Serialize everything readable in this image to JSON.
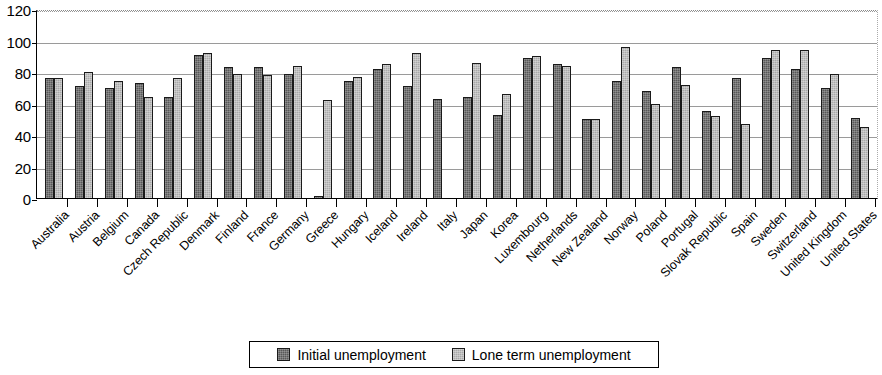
{
  "chart_data": {
    "type": "bar",
    "title": "",
    "subtitle": "",
    "xlabel": "",
    "ylabel": "",
    "ylim": [
      0,
      120
    ],
    "yticks": [
      0,
      20,
      40,
      60,
      80,
      100,
      120
    ],
    "grid": true,
    "legend_position": "bottom",
    "orientation": "vertical",
    "categories": [
      "Australia",
      "Austria",
      "Belgium",
      "Canada",
      "Czech Republic",
      "Denmark",
      "Finland",
      "France",
      "Germany",
      "Greece",
      "Hungary",
      "Iceland",
      "Ireland",
      "Italy",
      "Japan",
      "Korea",
      "Luxembourg",
      "Netherlands",
      "New Zealand",
      "Norway",
      "Poland",
      "Portugal",
      "Slovak Republic",
      "Spain",
      "Sweden",
      "Switzerland",
      "United Kingdom",
      "United States"
    ],
    "series": [
      {
        "name": "Initial unemployment",
        "color": "#585858",
        "values": [
          76,
          71,
          70,
          73,
          64,
          91,
          83,
          83,
          79,
          1,
          74,
          82,
          71,
          63,
          64,
          53,
          89,
          85,
          50,
          74,
          68,
          83,
          55,
          76,
          89,
          82,
          70,
          51
        ]
      },
      {
        "name": "Lone term unemployment",
        "color": "#a9a9a9",
        "values": [
          76,
          80,
          74,
          64,
          76,
          92,
          79,
          78,
          84,
          62,
          77,
          85,
          92,
          null,
          86,
          66,
          90,
          84,
          50,
          96,
          60,
          72,
          52,
          47,
          94,
          94,
          79,
          45
        ]
      }
    ],
    "legend": [
      {
        "label": "Initial unemployment",
        "swatch": "initial"
      },
      {
        "label": "Lone term unemployment",
        "swatch": "longterm"
      }
    ]
  }
}
